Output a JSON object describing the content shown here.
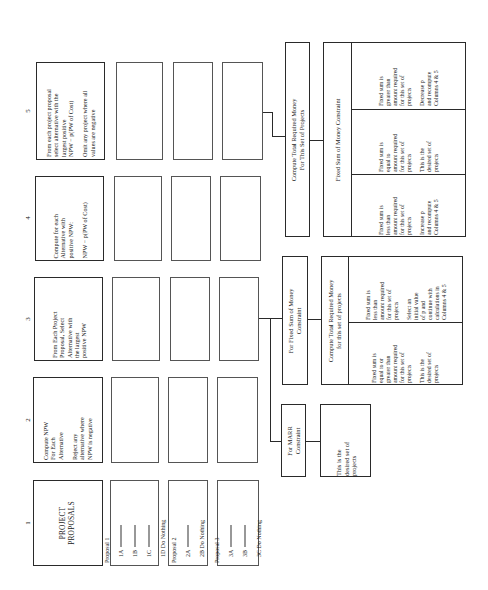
{
  "columns": [
    {
      "number": "1",
      "header": "PROJECT\nPROPOSALS"
    },
    {
      "number": "2",
      "header": "Compute NPW\nFor Each\nAlternative\n\nReject any\nalternative where\nNPW is negative"
    },
    {
      "number": "3",
      "header": "From Each Project\nProposal, Select\nAlternative with\nthe largest\npositive NPW"
    },
    {
      "number": "4",
      "header": "Compute for each\nAlternative with\npositive NPW:\n\nNPW − p(PW of Cost)"
    },
    {
      "number": "5",
      "header": "From each project proposal\nselect alternative with the\nlargest positive\nNPW − p(PW of Cost)\n\nOmit any project where all\nvalues are negative"
    }
  ],
  "proposals": [
    {
      "title": "Proposal 1",
      "alternatives": [
        "1A",
        "1B",
        "1C"
      ],
      "do_nothing": "1D  Do Nothing"
    },
    {
      "title": "Proposal 2",
      "alternatives": [
        "2A"
      ],
      "do_nothing": "2B  Do Nothing"
    },
    {
      "title": "Proposal 3",
      "alternatives": [
        "3A",
        "3B"
      ],
      "do_nothing": "3C  Do Nothing"
    }
  ],
  "marr_branch": {
    "label": "For MARR\nConstraint",
    "result": "This is the\ndesired set of\nprojects"
  },
  "fixed_sum_branch": {
    "label": "For Fixed Sum of Money\nConstraint",
    "table": {
      "header": "Compute Total Required Money\nfor this set of projects",
      "cells": [
        "Fixed sum is\nequal to or\ngreater than\namount required\nfor this set of\nprojects\n\nThis is the\ndesired set of\nprojects",
        "Fixed sum is\nless than\namount required\nfor this set of\nprojects\n\nSelect an\ninitial value\nof p and\ncontinue with\ncalculations in\nColumns 4 & 5"
      ]
    }
  },
  "column5_branch": {
    "label": "Compute Total Required Money\nFor This Set of Projects",
    "table": {
      "header": "Fixed Sum of Money Constraint",
      "cells": [
        "Fixed sum is\nless than\namount required\nfor this set of\nprojects\n\nIncrease p\nand recompute\nColumns 4 & 5",
        "Fixed sum is\nequal to\namount required\nfor this set of\nprojects\n\nThis is the\ndesired set of\nprojects",
        "Fixed sum is\ngreater than\namount required\nfor this set of\nprojects\n\nDecrease p\nand recompute\nColumns 4 & 5"
      ]
    }
  }
}
